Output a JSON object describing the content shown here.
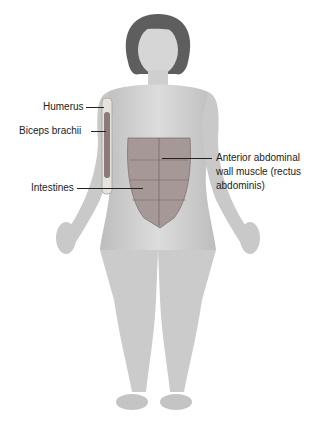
{
  "figure": {
    "skin_color": "#cfcfcf",
    "hair_color": "#5a5a5a",
    "muscle_color": "#9a8a88"
  },
  "labels": {
    "humerus": "Humerus",
    "biceps": "Biceps brachii",
    "intestines": "Intestines",
    "abdominal_line1": "Anterior abdominal",
    "abdominal_line2": "wall muscle (rectus",
    "abdominal_line3": "abdominis)"
  }
}
